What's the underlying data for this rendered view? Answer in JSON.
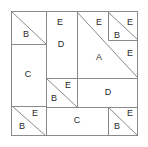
{
  "diagram": {
    "type": "patchwork-block-diagram",
    "canvas": {
      "width": 148,
      "height": 147,
      "background": "#ffffff"
    },
    "frame": {
      "x": 11,
      "y": 11,
      "width": 127,
      "height": 125,
      "stroke": "#8a8a8a"
    },
    "style": {
      "line_color": "#8a8a8a",
      "label_color": "#2b2b2b",
      "fill_color": "#ffffff"
    },
    "pieces": [
      {
        "id": "p1",
        "label": "E",
        "shape": "triangle",
        "lx": 60,
        "ly": 23
      },
      {
        "id": "p2",
        "label": "B",
        "shape": "triangle",
        "lx": 26,
        "ly": 35
      },
      {
        "id": "p3",
        "label": "D",
        "shape": "rectangle",
        "lx": 61,
        "ly": 45
      },
      {
        "id": "p4",
        "label": "E",
        "shape": "triangle",
        "lx": 99,
        "ly": 23
      },
      {
        "id": "p5",
        "label": "E",
        "shape": "triangle",
        "lx": 130,
        "ly": 23
      },
      {
        "id": "p6",
        "label": "B",
        "shape": "triangle",
        "lx": 117,
        "ly": 36
      },
      {
        "id": "p7",
        "label": "A",
        "shape": "triangle",
        "lx": 99,
        "ly": 58
      },
      {
        "id": "p8",
        "label": "E",
        "shape": "triangle",
        "lx": 130,
        "ly": 54
      },
      {
        "id": "p9",
        "label": "C",
        "shape": "rectangle",
        "lx": 28,
        "ly": 75
      },
      {
        "id": "p10",
        "label": "E",
        "shape": "triangle",
        "lx": 68,
        "ly": 86
      },
      {
        "id": "p11",
        "label": "B",
        "shape": "triangle",
        "lx": 54,
        "ly": 99
      },
      {
        "id": "p12",
        "label": "D",
        "shape": "rectangle",
        "lx": 108,
        "ly": 93
      },
      {
        "id": "p13",
        "label": "E",
        "shape": "triangle",
        "lx": 35,
        "ly": 114
      },
      {
        "id": "p14",
        "label": "B",
        "shape": "triangle",
        "lx": 22,
        "ly": 127
      },
      {
        "id": "p15",
        "label": "C",
        "shape": "rectangle",
        "lx": 77,
        "ly": 121
      },
      {
        "id": "p16",
        "label": "E",
        "shape": "triangle",
        "lx": 130,
        "ly": 114
      },
      {
        "id": "p17",
        "label": "B",
        "shape": "triangle",
        "lx": 117,
        "ly": 127
      }
    ],
    "lines": {
      "straight": [
        {
          "name": "seam-tl-bottom",
          "x1": 11,
          "y1": 44,
          "x2": 46,
          "y2": 44
        },
        {
          "name": "seam-d-left",
          "x1": 46,
          "y1": 11,
          "x2": 46,
          "y2": 78
        },
        {
          "name": "seam-d-right",
          "x1": 77,
          "y1": 11,
          "x2": 77,
          "y2": 78
        },
        {
          "name": "seam-tr-inner-left",
          "x1": 108,
          "y1": 11,
          "x2": 108,
          "y2": 40
        },
        {
          "name": "seam-tr-inner-bottom",
          "x1": 108,
          "y1": 40,
          "x2": 138,
          "y2": 40
        },
        {
          "name": "seam-mid-horizontal",
          "x1": 46,
          "y1": 78,
          "x2": 138,
          "y2": 78
        },
        {
          "name": "seam-c-left-bottom",
          "x1": 11,
          "y1": 106,
          "x2": 46,
          "y2": 106
        },
        {
          "name": "seam-midE-right",
          "x1": 77,
          "y1": 78,
          "x2": 77,
          "y2": 107
        },
        {
          "name": "seam-row3-bottom",
          "x1": 46,
          "y1": 107,
          "x2": 138,
          "y2": 107
        },
        {
          "name": "seam-c-left-vert",
          "x1": 46,
          "y1": 44,
          "x2": 46,
          "y2": 136
        },
        {
          "name": "seam-br-left",
          "x1": 108,
          "y1": 107,
          "x2": 108,
          "y2": 136
        }
      ],
      "diagonal": [
        {
          "name": "diag-tl-B-E",
          "x1": 12,
          "y1": 12,
          "x2": 46,
          "y2": 44
        },
        {
          "name": "diag-A-large",
          "x1": 77,
          "y1": 12,
          "x2": 138,
          "y2": 78
        },
        {
          "name": "diag-tr-B-E",
          "x1": 108,
          "y1": 12,
          "x2": 138,
          "y2": 40
        },
        {
          "name": "diag-mid-B-E",
          "x1": 46,
          "y1": 78,
          "x2": 77,
          "y2": 107
        },
        {
          "name": "diag-bl-B-E",
          "x1": 12,
          "y1": 106,
          "x2": 46,
          "y2": 136
        },
        {
          "name": "diag-br-B-E",
          "x1": 108,
          "y1": 107,
          "x2": 138,
          "y2": 136
        }
      ]
    }
  }
}
